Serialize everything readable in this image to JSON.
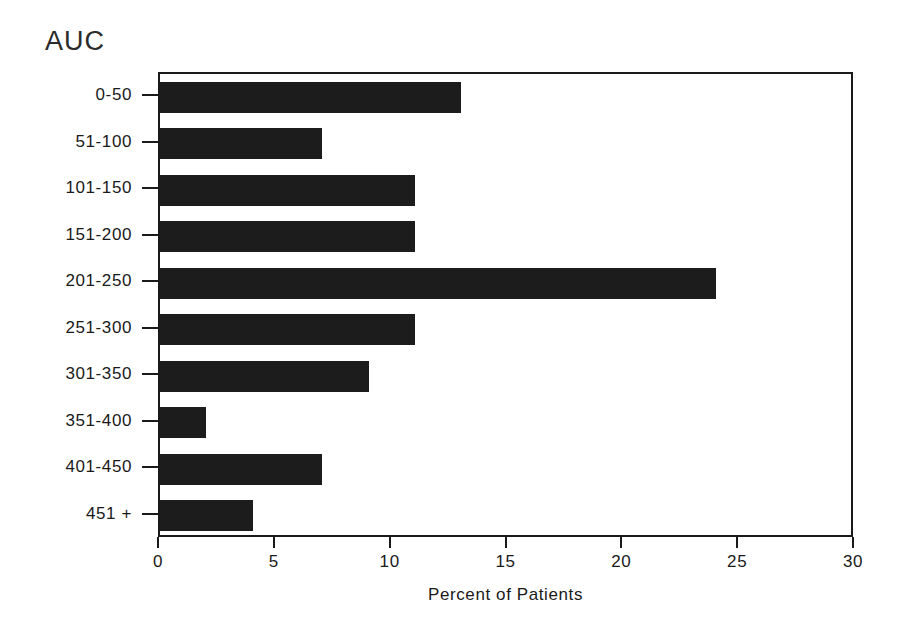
{
  "chart_data": {
    "type": "bar",
    "orientation": "horizontal",
    "title": "AUC",
    "xlabel": "Percent of Patients",
    "ylabel": "AUC",
    "categories": [
      "0-50",
      "51-100",
      "101-150",
      "151-200",
      "201-250",
      "251-300",
      "301-350",
      "351-400",
      "401-450",
      "451 +"
    ],
    "values": [
      13,
      7,
      11,
      11,
      24,
      11,
      9,
      2,
      7,
      4
    ],
    "xlim": [
      0,
      30
    ],
    "xticks": [
      0,
      5,
      10,
      15,
      20,
      25,
      30
    ],
    "xtick_labels": [
      "0",
      "5",
      "10",
      "15",
      "20",
      "25",
      "30"
    ],
    "grid": false,
    "legend": false,
    "bar_color": "#1c1c1c",
    "axis_color": "#1a1a1a",
    "background": "#ffffff"
  }
}
